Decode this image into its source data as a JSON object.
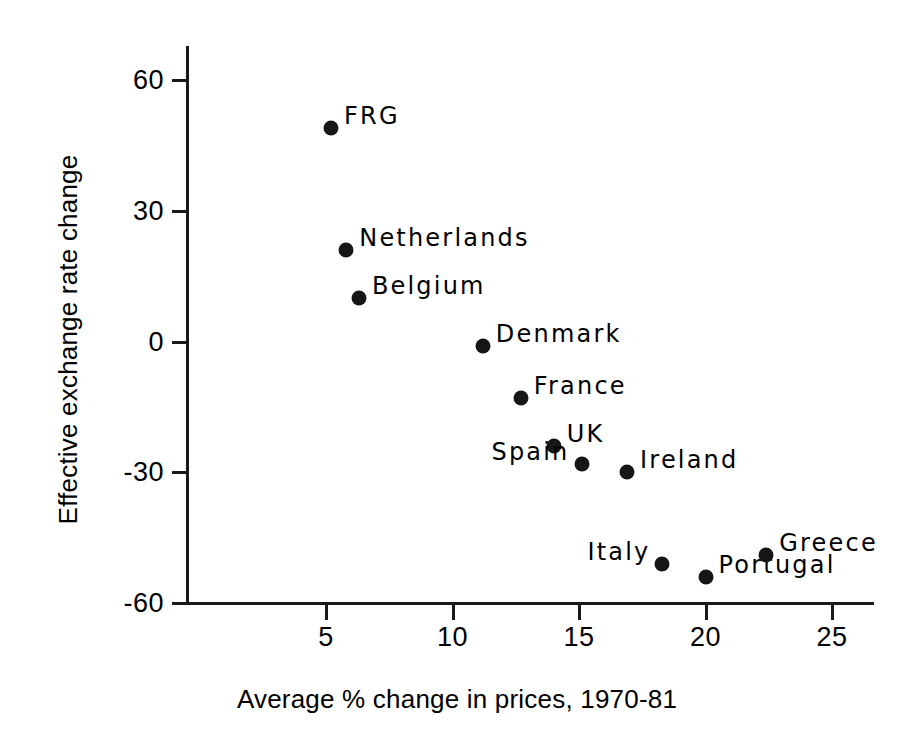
{
  "chart_data": {
    "type": "scatter",
    "title": "",
    "xlabel": "Average % change in prices, 1970-81",
    "ylabel": "Effective exchange rate change",
    "xlim": [
      0,
      26.5
    ],
    "ylim": [
      -60,
      68
    ],
    "xticks": [
      5,
      10,
      15,
      20,
      25
    ],
    "xtick_labels": [
      "5",
      "10",
      "15",
      "20",
      "25"
    ],
    "yticks": [
      60,
      30,
      0,
      -30,
      -60
    ],
    "ytick_labels": [
      "60",
      "30",
      "0",
      "-30",
      "-60"
    ],
    "grid": false,
    "legend": "none",
    "marker": "filled-circle",
    "marker_color": "#161616",
    "points": [
      {
        "label": "FRG",
        "x": 5.2,
        "y": 49,
        "label_pos": "right"
      },
      {
        "label": "Netherlands",
        "x": 5.8,
        "y": 21,
        "label_pos": "right"
      },
      {
        "label": "Belgium",
        "x": 6.3,
        "y": 10,
        "label_pos": "right"
      },
      {
        "label": "Denmark",
        "x": 11.2,
        "y": -1,
        "label_pos": "right"
      },
      {
        "label": "France",
        "x": 12.7,
        "y": -13,
        "label_pos": "right"
      },
      {
        "label": "UK",
        "x": 14.0,
        "y": -24,
        "label_pos": "right"
      },
      {
        "label": "Spain",
        "x": 15.1,
        "y": -28,
        "label_pos": "left"
      },
      {
        "label": "Ireland",
        "x": 16.9,
        "y": -30,
        "label_pos": "right"
      },
      {
        "label": "Italy",
        "x": 18.3,
        "y": -51,
        "label_pos": "left"
      },
      {
        "label": "Portugal",
        "x": 20.0,
        "y": -54,
        "label_pos": "right"
      },
      {
        "label": "Greece",
        "x": 22.4,
        "y": -49,
        "label_pos": "right"
      }
    ]
  }
}
